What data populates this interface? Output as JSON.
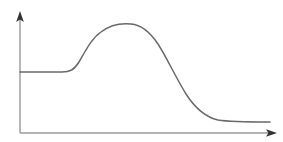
{
  "figure": {
    "title": "",
    "background_color": "#ffffff",
    "width": 283,
    "height": 142
  },
  "axes": {
    "color": "#9a9a9a",
    "arrow_color": "#333333",
    "line_width": 1.4,
    "origin_x": 20,
    "origin_y": 133,
    "y_axis_top": 13,
    "x_axis_right": 272,
    "x_label": "",
    "y_label": "",
    "ticks": [],
    "tick_labels": [],
    "grid": "off"
  },
  "curve": {
    "color": "#6a6a6a",
    "line_width": 1.5,
    "label": "",
    "path": "M 20 72 L 62 72 C 70 72 74 70 79 62 C 86 50 92 38 101 32 C 110 25 121 23 131 24 C 142 25 150 32 158 44 C 167 58 175 76 186 94 C 195 108 205 117 218 120 C 230 122 248 122 270 122"
  },
  "chart_data": {
    "type": "line",
    "title": "",
    "subtitle": "",
    "xlabel": "",
    "ylabel": "",
    "xlim": [
      0,
      100
    ],
    "ylim": [
      0,
      100
    ],
    "grid": "off",
    "legend": "none",
    "annotations": [],
    "series": [
      {
        "name": "curve",
        "x": [
          0,
          5,
          10,
          15,
          17,
          19,
          21,
          24,
          27,
          30,
          33,
          36,
          39,
          42,
          44,
          47,
          50,
          53,
          56,
          59,
          62,
          65,
          68,
          71,
          74,
          77,
          80,
          84,
          88,
          92,
          96,
          100
        ],
        "y": [
          51,
          51,
          51,
          51,
          52,
          54,
          58,
          64,
          71,
          78,
          84,
          89,
          91,
          91,
          90,
          88,
          85,
          80,
          74,
          67,
          59,
          50,
          41,
          33,
          26,
          21,
          17,
          14,
          13,
          12,
          12,
          12
        ]
      }
    ]
  }
}
